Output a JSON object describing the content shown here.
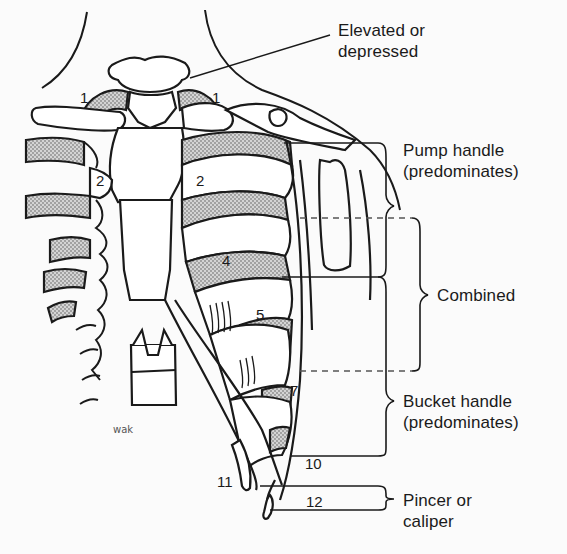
{
  "figure": {
    "labels": {
      "elevated": {
        "line1": "Elevated or",
        "line2": "depressed"
      },
      "pump": {
        "line1": "Pump handle",
        "line2": "(predominates)"
      },
      "combined": {
        "line1": "Combined"
      },
      "bucket": {
        "line1": "Bucket handle",
        "line2": "(predominates)"
      },
      "pincer": {
        "line1": "Pincer or",
        "line2": "caliper"
      }
    },
    "rib_numbers": {
      "r1_left": "1",
      "r1_right": "1",
      "r2_left": "2",
      "r2_right": "2",
      "r4": "4",
      "r5": "5",
      "r7": "7",
      "r10": "10",
      "r11": "11",
      "r12": "12"
    },
    "signature": "wak",
    "colors": {
      "ink": "#1a1a1a",
      "stipple": "#9a9a9a",
      "background": "#fbfbfb",
      "dashed": "#555555"
    }
  }
}
